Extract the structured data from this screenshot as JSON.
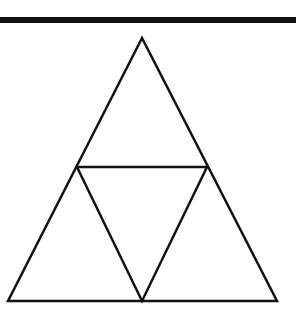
{
  "diagram": {
    "type": "sierpinski-triangle-level-1",
    "stroke_color": "#111111",
    "background_color": "#ffffff",
    "top_rule": {
      "y": 17,
      "height": 6,
      "color": "#111111"
    },
    "outer_triangle": {
      "apex": [
        142,
        38
      ],
      "bottom_left": [
        8,
        301
      ],
      "bottom_right": [
        277,
        301
      ]
    },
    "inner_triangle": {
      "left": [
        77,
        167
      ],
      "right": [
        207,
        167
      ],
      "bottom": [
        142,
        301
      ]
    },
    "sub_triangles_count": 4
  }
}
